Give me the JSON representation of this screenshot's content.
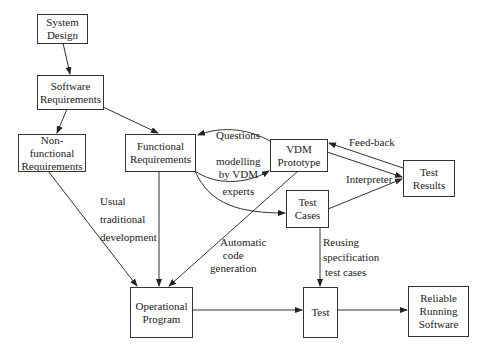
{
  "nodes": {
    "system_design": {
      "lines": [
        "System",
        "Design"
      ]
    },
    "software_requirements": {
      "lines": [
        "Software",
        "Requirements"
      ]
    },
    "nonfunctional_requirements": {
      "lines": [
        "Non-functional",
        "Requirements"
      ]
    },
    "functional_requirements": {
      "lines": [
        "Functional",
        "Requirements"
      ]
    },
    "vdm_prototype": {
      "lines": [
        "VDM",
        "Prototype"
      ]
    },
    "test_results": {
      "lines": [
        "Test",
        "Results"
      ]
    },
    "test_cases": {
      "lines": [
        "Test",
        "Cases"
      ]
    },
    "operational_program": {
      "lines": [
        "Operational",
        "Program"
      ]
    },
    "test": {
      "lines": [
        "Test"
      ]
    },
    "reliable_running_software": {
      "lines": [
        "Reliable",
        "Running",
        "Software"
      ]
    }
  },
  "edge_labels": {
    "questions": {
      "lines": [
        "Questions"
      ]
    },
    "modelling": {
      "lines": [
        "modelling",
        "by VDM",
        "experts"
      ]
    },
    "feedback": {
      "lines": [
        "Feed-back"
      ]
    },
    "interpreter": {
      "lines": [
        "Interpreter"
      ]
    },
    "usual": {
      "lines": [
        "Usual",
        "traditional",
        "development"
      ]
    },
    "automatic": {
      "lines": [
        "Automatic",
        "code",
        "generation"
      ]
    },
    "reusing": {
      "lines": [
        "Reusing",
        "specification",
        "test cases"
      ]
    }
  }
}
